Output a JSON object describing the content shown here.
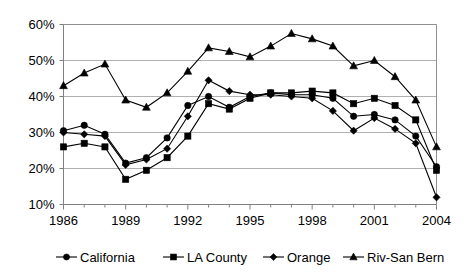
{
  "chart_data": {
    "type": "line",
    "title": "",
    "subtitle": "",
    "xlabel": "",
    "ylabel": "",
    "x": [
      1986,
      1987,
      1988,
      1989,
      1990,
      1991,
      1992,
      1993,
      1994,
      1995,
      1996,
      1997,
      1998,
      1999,
      2000,
      2001,
      2002,
      2003,
      2004
    ],
    "xlim": [
      1986,
      2004
    ],
    "ylim": [
      10,
      60
    ],
    "y_tick_values": [
      10,
      20,
      30,
      40,
      50,
      60
    ],
    "y_tick_labels": [
      "10%",
      "20%",
      "30%",
      "40%",
      "50%",
      "60%"
    ],
    "x_tick_values": [
      1986,
      1989,
      1992,
      1995,
      1998,
      2001,
      2004
    ],
    "x_tick_labels": [
      "1986",
      "1989",
      "1992",
      "1995",
      "1998",
      "2001",
      "2004"
    ],
    "x_minor_ticks": [
      1987,
      1988,
      1990,
      1991,
      1993,
      1994,
      1996,
      1997,
      1999,
      2000,
      2002,
      2003
    ],
    "grid": "horizontal",
    "legend_position": "bottom",
    "series": [
      {
        "name": "California",
        "marker": "circle",
        "values": [
          30.5,
          32.0,
          29.5,
          21.5,
          23.0,
          28.5,
          37.5,
          40.0,
          37.0,
          40.0,
          41.0,
          40.5,
          40.5,
          39.5,
          34.5,
          35.0,
          33.5,
          29.0,
          20.5
        ]
      },
      {
        "name": "LA County",
        "marker": "square",
        "values": [
          26.0,
          27.0,
          26.0,
          17.0,
          19.5,
          23.0,
          29.0,
          38.0,
          36.5,
          39.5,
          41.0,
          41.0,
          41.5,
          41.0,
          38.0,
          39.5,
          37.5,
          33.5,
          19.5
        ]
      },
      {
        "name": "Orange",
        "marker": "diamond",
        "values": [
          30.0,
          29.5,
          29.0,
          21.0,
          22.5,
          25.5,
          34.5,
          44.5,
          41.5,
          40.5,
          40.5,
          40.0,
          39.5,
          36.0,
          30.5,
          34.0,
          31.0,
          27.0,
          12.0
        ]
      },
      {
        "name": "Riv-San Bern",
        "marker": "triangle",
        "values": [
          43.0,
          46.5,
          49.0,
          39.0,
          37.0,
          41.0,
          47.0,
          53.5,
          52.5,
          51.0,
          54.0,
          57.5,
          56.0,
          54.0,
          48.5,
          50.0,
          45.5,
          39.0,
          26.0
        ]
      }
    ],
    "colors": {
      "series_stroke": "#000000",
      "marker_fill": "#000000",
      "gridline": "#b0b0b0",
      "axis": "#808080",
      "background": "#ffffff"
    }
  }
}
